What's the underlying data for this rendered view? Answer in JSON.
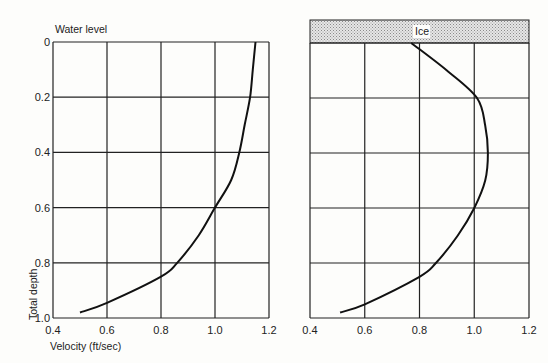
{
  "chart_data": [
    {
      "type": "line",
      "panel": "left",
      "annotation": "Water level",
      "xlabel": "Velocity (ft/sec)",
      "ylabel": "Total depth",
      "xlim": [
        0.4,
        1.2
      ],
      "ylim": [
        0,
        1.0
      ],
      "y_inverted": true,
      "grid": true,
      "x_ticks": [
        "0.4",
        "0.6",
        "0.8",
        "1.0",
        "1.2"
      ],
      "y_ticks": [
        "0",
        "0.2",
        "0.4",
        "0.6",
        "0.8",
        "1.0"
      ],
      "series": [
        {
          "name": "Velocity profile (open water)",
          "points": [
            {
              "velocity": 1.15,
              "depth": 0.0
            },
            {
              "velocity": 1.14,
              "depth": 0.1
            },
            {
              "velocity": 1.13,
              "depth": 0.2
            },
            {
              "velocity": 1.11,
              "depth": 0.3
            },
            {
              "velocity": 1.09,
              "depth": 0.4
            },
            {
              "velocity": 1.06,
              "depth": 0.5
            },
            {
              "velocity": 1.0,
              "depth": 0.6
            },
            {
              "velocity": 0.94,
              "depth": 0.7
            },
            {
              "velocity": 0.86,
              "depth": 0.8
            },
            {
              "velocity": 0.8,
              "depth": 0.85
            },
            {
              "velocity": 0.6,
              "depth": 0.945
            },
            {
              "velocity": 0.5,
              "depth": 0.98
            }
          ]
        }
      ]
    },
    {
      "type": "line",
      "panel": "right",
      "annotation": "Ice",
      "xlabel": "",
      "ylabel": "",
      "xlim": [
        0.4,
        1.2
      ],
      "ylim": [
        0,
        1.0
      ],
      "y_inverted": true,
      "grid": true,
      "x_ticks": [
        "0.4",
        "0.6",
        "0.8",
        "1.0",
        "1.2"
      ],
      "y_ticks": [],
      "series": [
        {
          "name": "Velocity profile (ice covered)",
          "points": [
            {
              "velocity": 0.77,
              "depth": 0.0
            },
            {
              "velocity": 0.9,
              "depth": 0.1
            },
            {
              "velocity": 1.01,
              "depth": 0.2
            },
            {
              "velocity": 1.04,
              "depth": 0.3
            },
            {
              "velocity": 1.05,
              "depth": 0.4
            },
            {
              "velocity": 1.04,
              "depth": 0.5
            },
            {
              "velocity": 1.0,
              "depth": 0.6
            },
            {
              "velocity": 0.94,
              "depth": 0.7
            },
            {
              "velocity": 0.86,
              "depth": 0.8
            },
            {
              "velocity": 0.8,
              "depth": 0.85
            },
            {
              "velocity": 0.6,
              "depth": 0.95
            },
            {
              "velocity": 0.51,
              "depth": 0.98
            }
          ]
        }
      ]
    }
  ],
  "labels": {
    "water_level": "Water level",
    "ice": "Ice",
    "xlabel": "Velocity (ft/sec)",
    "ylabel": "Total depth"
  },
  "colors": {
    "line": "#111111",
    "grid": "#222222",
    "ice_fill": "#cfcfcf",
    "background": "#fdfdfb"
  }
}
